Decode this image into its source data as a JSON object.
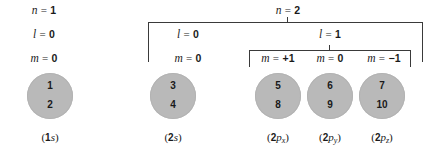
{
  "figure": {
    "background_color": "#ffffff",
    "line_color": "#3a3a3a",
    "orbital_fill_color": "#b9b9b9",
    "text_color": "#1a1a1a"
  },
  "shells": [
    {
      "id": "n1",
      "symbol": "n",
      "eq": "=",
      "value": "1"
    },
    {
      "id": "n2",
      "symbol": "n",
      "eq": "=",
      "value": "2"
    }
  ],
  "subshells": [
    {
      "id": "n1-l0",
      "symbol": "l",
      "eq": "=",
      "value": "0"
    },
    {
      "id": "n2-l0",
      "symbol": "l",
      "eq": "=",
      "value": "0"
    },
    {
      "id": "n2-l1",
      "symbol": "l",
      "eq": "=",
      "value": "1"
    }
  ],
  "magnetic": [
    {
      "id": "m-1s",
      "symbol": "m",
      "eq": "=",
      "value": "0"
    },
    {
      "id": "m-2s",
      "symbol": "m",
      "eq": "=",
      "value": "0"
    },
    {
      "id": "m-2px",
      "symbol": "m",
      "eq": "=",
      "value": "+1"
    },
    {
      "id": "m-2py",
      "symbol": "m",
      "eq": "=",
      "value": "0"
    },
    {
      "id": "m-2pz",
      "symbol": "m",
      "eq": "=",
      "value": "−1"
    }
  ],
  "orbitals": [
    {
      "id": "1s",
      "caption_prefix": "(",
      "caption_n": "1",
      "caption_orbital": "s",
      "caption_sub": "",
      "caption_suffix": ")",
      "electrons": [
        "1",
        "2"
      ]
    },
    {
      "id": "2s",
      "caption_prefix": "(",
      "caption_n": "2",
      "caption_orbital": "s",
      "caption_sub": "",
      "caption_suffix": ")",
      "electrons": [
        "3",
        "4"
      ]
    },
    {
      "id": "2px",
      "caption_prefix": "(",
      "caption_n": "2",
      "caption_orbital": "p",
      "caption_sub": "x",
      "caption_suffix": ")",
      "electrons": [
        "5",
        "8"
      ]
    },
    {
      "id": "2py",
      "caption_prefix": "(",
      "caption_n": "2",
      "caption_orbital": "p",
      "caption_sub": "y",
      "caption_suffix": ")",
      "electrons": [
        "6",
        "9"
      ]
    },
    {
      "id": "2pz",
      "caption_prefix": "(",
      "caption_n": "2",
      "caption_orbital": "p",
      "caption_sub": "z",
      "caption_suffix": ")",
      "electrons": [
        "7",
        "10"
      ]
    }
  ]
}
